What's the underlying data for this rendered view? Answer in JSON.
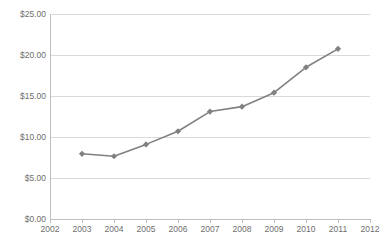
{
  "chart_data": {
    "type": "line",
    "title": "",
    "xlabel": "",
    "ylabel": "",
    "x": [
      2003,
      2004,
      2005,
      2006,
      2007,
      2008,
      2009,
      2010,
      2011
    ],
    "values": [
      7.95,
      7.65,
      9.1,
      10.7,
      13.1,
      13.7,
      15.4,
      18.5,
      20.75
    ],
    "series": [
      {
        "name": "",
        "values": [
          7.95,
          7.65,
          9.1,
          10.7,
          13.1,
          13.7,
          15.4,
          18.5,
          20.75
        ]
      }
    ],
    "xlim": [
      2002,
      2012
    ],
    "ylim": [
      0,
      25
    ],
    "y_tick_values": [
      0,
      5,
      10,
      15,
      20,
      25
    ],
    "y_tick_labels": [
      "$0.00",
      "$5.00",
      "$10.00",
      "$15.00",
      "$20.00",
      "$25.00"
    ],
    "x_tick_labels": [
      "2002",
      "2003",
      "2004",
      "2005",
      "2006",
      "2007",
      "2008",
      "2009",
      "2010",
      "2011",
      "2012"
    ],
    "grid": true,
    "grid_axis": "y",
    "legend": false,
    "legend_position": "none",
    "marker": "diamond",
    "line_color": "#808080",
    "marker_color": "#808080",
    "grid_color": "#D9D9D9",
    "axis_color": "#BFBFBF",
    "text_color": "#6E6E6E",
    "background_color": "#FFFFFF"
  }
}
